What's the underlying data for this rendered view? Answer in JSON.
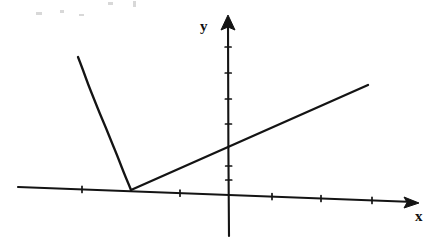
{
  "figure": {
    "kind": "math-graph",
    "background_color": "#ffffff",
    "ink_color": "#141414",
    "width": 447,
    "height": 242
  },
  "axes": {
    "x_label": "x",
    "y_label": "y",
    "x_axis": {
      "name": "x-axis",
      "start": [
        18,
        187
      ],
      "end": [
        414,
        202
      ],
      "arrow_tip": [
        419,
        203
      ],
      "ticks_x": [
        82,
        180,
        272,
        321,
        372
      ],
      "tick_half_height": 3
    },
    "y_axis": {
      "name": "y-axis",
      "start": [
        229,
        236
      ],
      "end": [
        228,
        22
      ],
      "arrow_tip": [
        228,
        15
      ],
      "ticks_y": [
        47,
        73,
        99,
        124,
        166,
        180
      ],
      "tick_half_width": 3
    }
  },
  "chart_data": {
    "type": "line",
    "title": "",
    "xlabel": "x",
    "ylabel": "y",
    "grid": false,
    "legend": null,
    "annotations": [],
    "axis_origin_px": [
      228,
      189
    ],
    "series": [
      {
        "name": "decaying-curve",
        "description": "steeply decreasing convex curve approaching the x-axis from above on the left",
        "type": "curve",
        "points_px": [
          [
            78,
            57
          ],
          [
            83,
            70
          ],
          [
            88,
            84
          ],
          [
            94,
            99
          ],
          [
            100,
            114
          ],
          [
            106,
            128
          ],
          [
            112,
            143
          ],
          [
            117,
            155
          ],
          [
            122,
            168
          ],
          [
            126,
            178
          ],
          [
            129,
            185
          ],
          [
            131,
            190
          ]
        ]
      },
      {
        "name": "rising-line",
        "description": "straight line rising to the right from the tangency point on the x-axis",
        "type": "line",
        "points_px": [
          [
            131,
            190
          ],
          [
            368,
            85
          ]
        ]
      }
    ],
    "intersection_px": [
      131,
      190
    ]
  },
  "artifacts": {
    "specks": [
      {
        "x": 108,
        "y": 2,
        "w": 5,
        "h": 3
      },
      {
        "x": 133,
        "y": 1,
        "w": 3,
        "h": 6
      },
      {
        "x": 36,
        "y": 12,
        "w": 6,
        "h": 3
      },
      {
        "x": 60,
        "y": 10,
        "w": 4,
        "h": 3
      },
      {
        "x": 79,
        "y": 14,
        "w": 5,
        "h": 2
      }
    ]
  }
}
